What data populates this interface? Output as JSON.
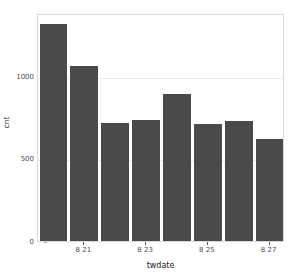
{
  "chart_data": {
    "type": "bar",
    "title": "",
    "subtitle": "",
    "xlabel": "twdate",
    "ylabel": "cnt",
    "categories": [
      "8 20",
      "8 21",
      "8 22",
      "8 23",
      "8 24",
      "8 25",
      "8 26",
      "8 27"
    ],
    "values": [
      1315,
      1060,
      715,
      735,
      890,
      710,
      727,
      620
    ],
    "ylim": [
      0,
      1380
    ],
    "y_ticks": [
      0,
      500,
      1000
    ],
    "y_tick_labels": [
      "0",
      "500",
      "1000"
    ],
    "x_tick_labels": [
      "8 21",
      "8 23",
      "8 25",
      "8 27"
    ],
    "x_tick_category_indices": [
      1,
      3,
      5,
      7
    ],
    "grid": true,
    "grid_orientation": "horizontal",
    "legend": "none",
    "bar_color": "#4a4a4a",
    "panel_background": "#ffffff",
    "panel_border_color": "#d9d9d9",
    "gridline_color": "#ebebeb",
    "axis_text_color": "#4d4d4d",
    "axis_title_color": "#1a1a1a"
  }
}
